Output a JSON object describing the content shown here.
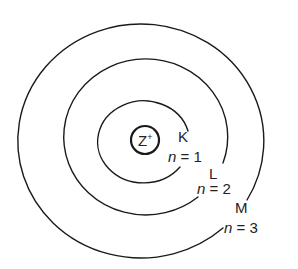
{
  "diagram": {
    "nucleus": {
      "label": "Z",
      "charge": "+"
    },
    "shells": [
      {
        "name": "K",
        "n_var": "n",
        "n_text": " = 1"
      },
      {
        "name": "L",
        "n_var": "n",
        "n_text": " = 2"
      },
      {
        "name": "M",
        "n_var": "n",
        "n_text": " = 3"
      }
    ],
    "colors": {
      "stroke": "#1a1a1a",
      "text": "#222222",
      "background": "#ffffff"
    }
  }
}
